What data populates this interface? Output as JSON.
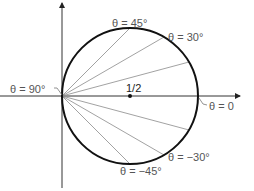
{
  "diagram": {
    "type": "polar-circle",
    "center_label": "1/2",
    "labels": {
      "theta_45": "θ = 45°",
      "theta_30": "θ = 30°",
      "theta_90": "θ = 90°",
      "theta_0": "θ = 0",
      "theta_neg30": "θ = −30°",
      "theta_neg45": "θ = −45°"
    },
    "rays_degrees": [
      45,
      30,
      15,
      -15,
      -30,
      -45
    ],
    "colors": {
      "circle": "#111111",
      "axes": "#333333",
      "rays": "#8a8a8a",
      "labels": "#555555"
    }
  }
}
